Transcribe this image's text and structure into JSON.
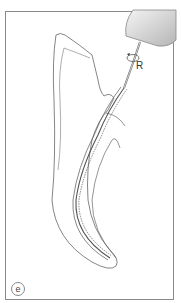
{
  "figure": {
    "label_r": "R",
    "panel_letter": "e"
  },
  "colors": {
    "outline": "#666666",
    "handpiece_light": "#f2f2f2",
    "handpiece_dark": "#b8b8b8",
    "frame": "#8a8a8a"
  }
}
